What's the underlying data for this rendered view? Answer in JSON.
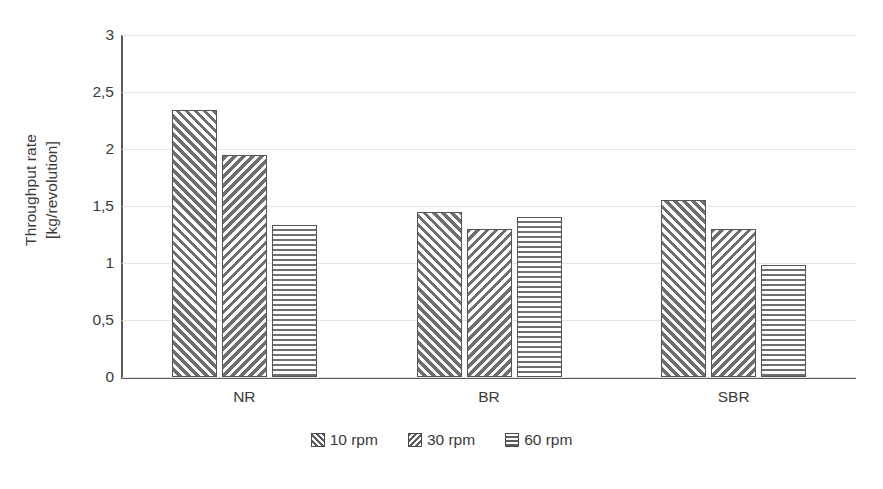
{
  "chart_data": {
    "type": "bar",
    "title": "",
    "subtitle": "",
    "xlabel": "",
    "ylabel": "Throughput rate [kg/revolution]",
    "ylabel_line1": "Throughput rate",
    "ylabel_line2": "[kg/revolution]",
    "categories": [
      "NR",
      "BR",
      "SBR"
    ],
    "series": [
      {
        "name": "10 rpm",
        "pattern": "forward-diagonal-hatch",
        "values": [
          2.34,
          1.45,
          1.55
        ]
      },
      {
        "name": "30 rpm",
        "pattern": "backward-diagonal-hatch",
        "values": [
          1.95,
          1.3,
          1.3
        ]
      },
      {
        "name": "60 rpm",
        "pattern": "horizontal-line-hatch",
        "values": [
          1.33,
          1.4,
          0.98
        ]
      }
    ],
    "ylim": [
      0,
      3
    ],
    "ytick_values": [
      0,
      0.5,
      1,
      1.5,
      2,
      2.5,
      3
    ],
    "ytick_labels": [
      "0",
      "0,5",
      "1",
      "1,5",
      "2",
      "2,5",
      "3"
    ],
    "grid": "horizontal",
    "legend_position": "bottom-center",
    "colors": {
      "hatch": "#6f6f6f",
      "bar_border": "#555555",
      "axis": "#595959",
      "gridline": "#e4e4e4",
      "text": "#3a3a3a",
      "background": "#ffffff"
    }
  }
}
